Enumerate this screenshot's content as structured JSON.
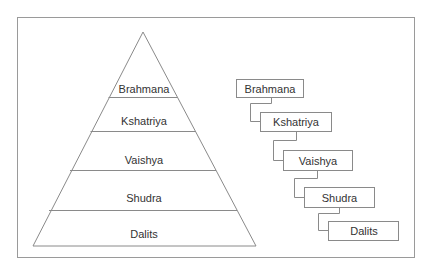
{
  "diagram": {
    "title": "",
    "colors": {
      "stroke": "#8a8a8a",
      "text": "#333333",
      "background": "#ffffff"
    },
    "pyramid": {
      "levels": [
        {
          "label": "Brahmana"
        },
        {
          "label": "Kshatriya"
        },
        {
          "label": "Vaishya"
        },
        {
          "label": "Shudra"
        },
        {
          "label": "Dalits"
        }
      ]
    },
    "hierarchy": {
      "boxes": [
        {
          "label": "Brahmana"
        },
        {
          "label": "Kshatriya"
        },
        {
          "label": "Vaishya"
        },
        {
          "label": "Shudra"
        },
        {
          "label": "Dalits"
        }
      ]
    }
  }
}
